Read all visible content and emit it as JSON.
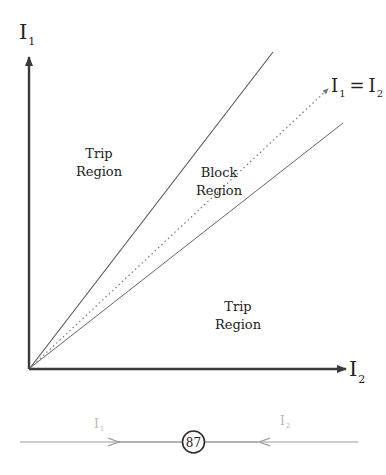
{
  "diagram": {
    "axes": {
      "y_label_main": "I",
      "y_label_sub": "1",
      "x_label_main": "I",
      "x_label_sub": "2"
    },
    "lines": {
      "identity_label_left_main": "I",
      "identity_label_left_sub": "1",
      "identity_label_eq": "=",
      "identity_label_right_main": "I",
      "identity_label_right_sub": "2"
    },
    "regions": {
      "upper_trip_line1": "Trip",
      "upper_trip_line2": "Region",
      "block_line1": "Block",
      "block_line2": "Region",
      "lower_trip_line1": "Trip",
      "lower_trip_line2": "Region"
    },
    "relay": {
      "number": "87",
      "left_current_main": "I",
      "left_current_sub": "1",
      "right_current_main": "I",
      "right_current_sub": "2"
    },
    "colors": {
      "axis": "#3a3a3a",
      "boundary_line": "#555555",
      "dotted_line": "#777777",
      "relay_line": "#666666",
      "relay_arrow": "#9a9a9a",
      "relay_label": "#b5b5b5"
    }
  }
}
